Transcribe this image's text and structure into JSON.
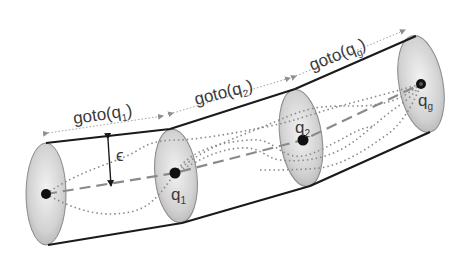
{
  "diagram": {
    "segments": [
      {
        "label_prefix": "goto(q",
        "label_sub": "1",
        "label_suffix": ")"
      },
      {
        "label_prefix": "goto(q",
        "label_sub": "2",
        "label_suffix": ")"
      },
      {
        "label_prefix": "goto(q",
        "label_sub": "g",
        "label_suffix": ")"
      }
    ],
    "waypoints": [
      {
        "label_main": "",
        "label_sub": ""
      },
      {
        "label_main": "q",
        "label_sub": "1"
      },
      {
        "label_main": "q",
        "label_sub": "2"
      },
      {
        "label_main": "q",
        "label_sub": "g"
      }
    ],
    "tolerance_label": "ϵ",
    "colors": {
      "outline": "#1a1a1a",
      "disk_fill_light": "#efefef",
      "disk_fill_dark": "#b8b8b8",
      "path_dashed": "#8a8a8a",
      "path_dotted": "#8a8a8a",
      "arrow_gray": "#9a9a9a",
      "text": "#3a3a3a"
    }
  }
}
